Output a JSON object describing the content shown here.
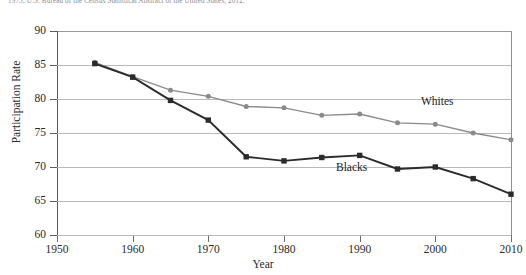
{
  "source_note": "1975; U.S. Bureau of the Census Statistical Abstract of the United States, 2012.",
  "axes": {
    "y_title": "Participation Rate",
    "x_title": "Year",
    "y_ticks": [
      "90",
      "85",
      "80",
      "75",
      "70",
      "65",
      "60"
    ],
    "x_ticks": [
      "1950",
      "1960",
      "1970",
      "1980",
      "1990",
      "2000",
      "2010"
    ]
  },
  "labels": {
    "whites": "Whites",
    "blacks": "Blacks"
  },
  "colors": {
    "whites_line": "#8a8a8a",
    "blacks_line": "#2b2b2b",
    "gridline": "#b9b9b9",
    "axis": "#5b5b5b",
    "text": "#1a1a1a"
  },
  "chart_data": {
    "type": "line",
    "title": "",
    "xlabel": "Year",
    "ylabel": "Participation Rate",
    "xlim": [
      1950,
      2010
    ],
    "ylim": [
      60,
      90
    ],
    "grid": true,
    "legend": "inline-annotation",
    "x": [
      1955,
      1960,
      1965,
      1970,
      1975,
      1980,
      1985,
      1990,
      1995,
      2000,
      2005,
      2010
    ],
    "series": [
      {
        "name": "Whites",
        "marker": "circle",
        "color": "#8a8a8a",
        "values": [
          85.4,
          83.3,
          81.3,
          80.4,
          78.9,
          78.7,
          77.6,
          77.8,
          76.5,
          76.3,
          75.0,
          74.0
        ]
      },
      {
        "name": "Blacks",
        "marker": "square",
        "color": "#2b2b2b",
        "values": [
          85.2,
          83.2,
          79.8,
          76.9,
          71.5,
          70.9,
          71.4,
          71.7,
          69.7,
          70.0,
          68.3,
          66.0
        ]
      }
    ]
  }
}
